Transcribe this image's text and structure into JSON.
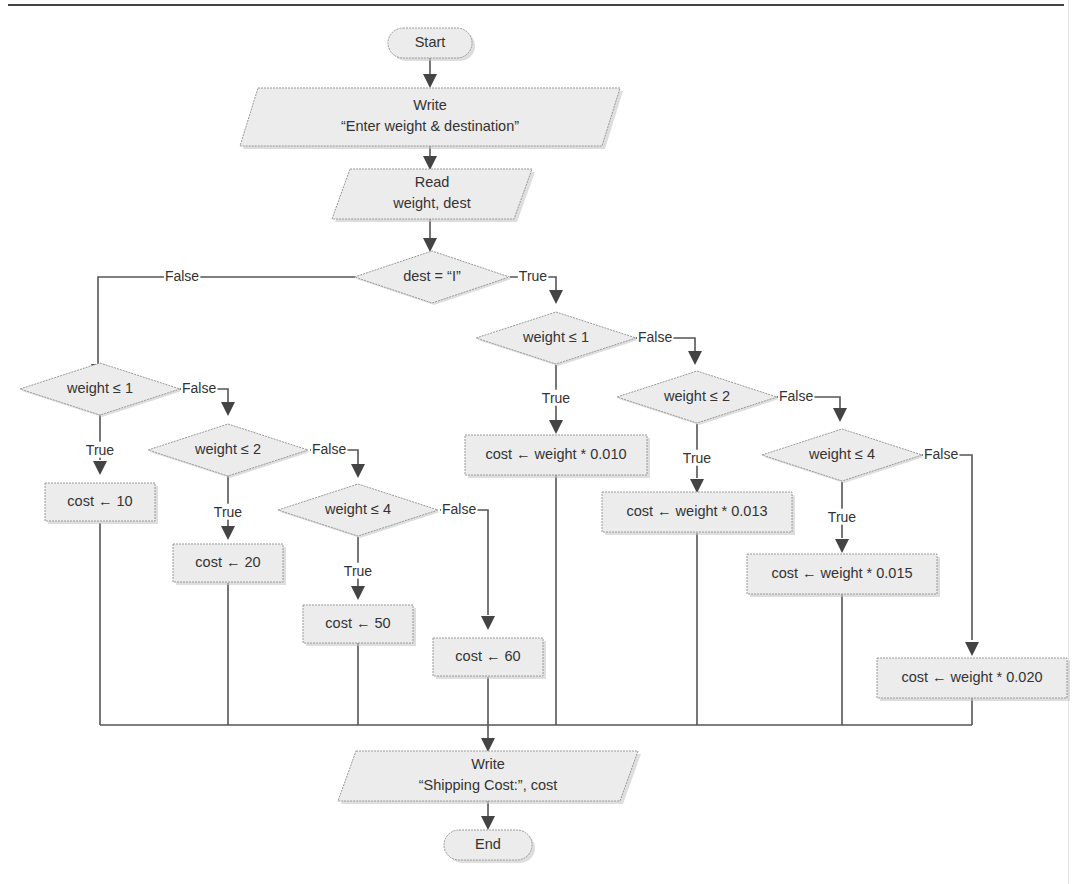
{
  "flowchart": {
    "start": {
      "label": "Start"
    },
    "end": {
      "label": "End"
    },
    "write_prompt": {
      "lines": [
        "Write",
        "“Enter weight & destination”"
      ]
    },
    "read_input": {
      "lines": [
        "Read",
        "weight, dest"
      ]
    },
    "decision_dest": {
      "label": "dest = “I”"
    },
    "domestic": {
      "decisions": [
        {
          "label": "weight ≤ 1"
        },
        {
          "label": "weight ≤ 2"
        },
        {
          "label": "weight ≤ 4"
        }
      ],
      "actions": [
        {
          "label": "cost ← 10"
        },
        {
          "label": "cost ← 20"
        },
        {
          "label": "cost ← 50"
        },
        {
          "label": "cost ← 60"
        }
      ]
    },
    "international": {
      "decisions": [
        {
          "label": "weight ≤ 1"
        },
        {
          "label": "weight ≤ 2"
        },
        {
          "label": "weight ≤ 4"
        }
      ],
      "actions": [
        {
          "label": "cost ← weight * 0.010"
        },
        {
          "label": "cost ← weight * 0.013"
        },
        {
          "label": "cost ← weight * 0.015"
        },
        {
          "label": "cost ← weight * 0.020"
        }
      ]
    },
    "write_result": {
      "lines": [
        "Write",
        "“Shipping Cost:”, cost"
      ]
    },
    "branch_labels": {
      "true": "True",
      "false": "False"
    }
  }
}
